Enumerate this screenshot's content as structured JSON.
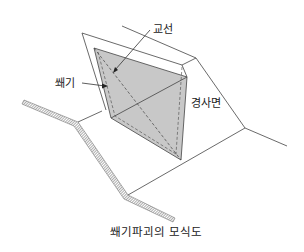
{
  "diagram": {
    "caption": "쐐기파괴의 모식도",
    "labels": {
      "intersection_line": "교선",
      "wedge": "쐐기",
      "slope_face": "경사면"
    },
    "colors": {
      "wedge_fill": "#c8c8c8",
      "line": "#444444",
      "ground_hatch": "#888888"
    }
  }
}
